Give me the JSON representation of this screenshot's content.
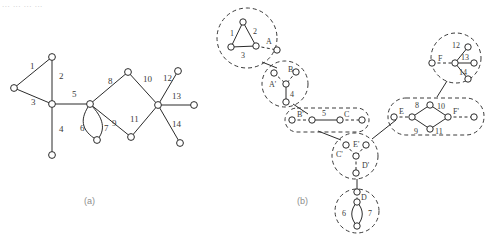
{
  "page": {
    "header_text": "... ... ... ...",
    "caption_a": "(a)",
    "caption_b": "(b)",
    "ink": "#2b2b2b",
    "node_fill": "#ffffff",
    "dashed_color": "#3a3a3a",
    "caption_color": "#8d8d8d"
  },
  "figure_a": {
    "title": "(a)",
    "description": "Undirected graph with 14 labelled edges",
    "edge_labels": [
      "1",
      "2",
      "3",
      "4",
      "5",
      "6",
      "7",
      "8",
      "9",
      "10",
      "11",
      "12",
      "13",
      "14"
    ],
    "nodes": [
      {
        "id": "n_left",
        "cx": 14,
        "cy": 88
      },
      {
        "id": "n_top1",
        "cx": 52,
        "cy": 57
      },
      {
        "id": "n_center",
        "cx": 52,
        "cy": 104
      },
      {
        "id": "n_low",
        "cx": 52,
        "cy": 155
      },
      {
        "id": "n_hub",
        "cx": 90,
        "cy": 104
      },
      {
        "id": "n_lens",
        "cx": 97,
        "cy": 140
      },
      {
        "id": "n_top2",
        "cx": 128,
        "cy": 72
      },
      {
        "id": "n_bot2",
        "cx": 131,
        "cy": 137
      },
      {
        "id": "n_hub2",
        "cx": 158,
        "cy": 105
      },
      {
        "id": "n_ur",
        "cx": 178,
        "cy": 71
      },
      {
        "id": "n_right",
        "cx": 194,
        "cy": 105
      },
      {
        "id": "n_lr",
        "cx": 180,
        "cy": 143
      }
    ],
    "edges": [
      {
        "label": "1",
        "lx": 30,
        "ly": 69
      },
      {
        "label": "2",
        "lx": 59,
        "ly": 79
      },
      {
        "label": "3",
        "lx": 31,
        "ly": 105
      },
      {
        "label": "4",
        "lx": 59,
        "ly": 132
      },
      {
        "label": "5",
        "lx": 72,
        "ly": 97
      },
      {
        "label": "6",
        "lx": 87,
        "ly": 131
      },
      {
        "label": "7",
        "lx": 104,
        "ly": 131
      },
      {
        "label": "8",
        "lx": 110,
        "ly": 84
      },
      {
        "label": "9",
        "lx": 113,
        "ly": 124
      },
      {
        "label": "10",
        "lx": 147,
        "ly": 82
      },
      {
        "label": "11",
        "lx": 133,
        "ly": 121
      },
      {
        "label": "12",
        "lx": 166,
        "ly": 82
      },
      {
        "label": "13",
        "lx": 175,
        "ly": 100
      },
      {
        "label": "14",
        "lx": 176,
        "ly": 124
      }
    ]
  },
  "figure_b": {
    "title": "(b)",
    "description": "Tree decomposition: dashed bags containing numbered edges and A-F boundary labels",
    "bags": [
      {
        "id": "bag-1",
        "shape": "circle",
        "cx": 247,
        "cy": 38,
        "r": 30,
        "inner_labels": [
          "1",
          "2",
          "3",
          "A"
        ]
      },
      {
        "id": "bag-2",
        "shape": "circle",
        "cx": 285,
        "cy": 84,
        "r": 23,
        "inner_labels": [
          "A'",
          "B",
          "4"
        ]
      },
      {
        "id": "bag-3",
        "shape": "oval",
        "cx": 327,
        "cy": 120,
        "rx": 42,
        "ry": 12,
        "inner_labels": [
          "B'",
          "5",
          "C"
        ]
      },
      {
        "id": "bag-4",
        "shape": "circle",
        "cx": 355,
        "cy": 156,
        "r": 23,
        "inner_labels": [
          "C'",
          "E'",
          "D'"
        ]
      },
      {
        "id": "bag-5",
        "shape": "circle",
        "cx": 357,
        "cy": 211,
        "r": 22,
        "inner_labels": [
          "D",
          "6",
          "7"
        ]
      },
      {
        "id": "bag-6",
        "shape": "oval",
        "cx": 435,
        "cy": 116,
        "rx": 48,
        "ry": 19,
        "inner_labels": [
          "E",
          "8",
          "10",
          "F'",
          "9",
          "11"
        ]
      },
      {
        "id": "bag-7",
        "shape": "circle",
        "cx": 456,
        "cy": 58,
        "r": 25,
        "inner_labels": [
          "F",
          "12",
          "13",
          "14"
        ]
      }
    ],
    "boundary_labels": [
      "A",
      "A'",
      "B",
      "B'",
      "C",
      "C'",
      "D",
      "D'",
      "E",
      "E'",
      "F",
      "F'"
    ],
    "edge_number_labels": [
      "1",
      "2",
      "3",
      "4",
      "5",
      "6",
      "7",
      "8",
      "9",
      "10",
      "11",
      "12",
      "13",
      "14"
    ]
  }
}
